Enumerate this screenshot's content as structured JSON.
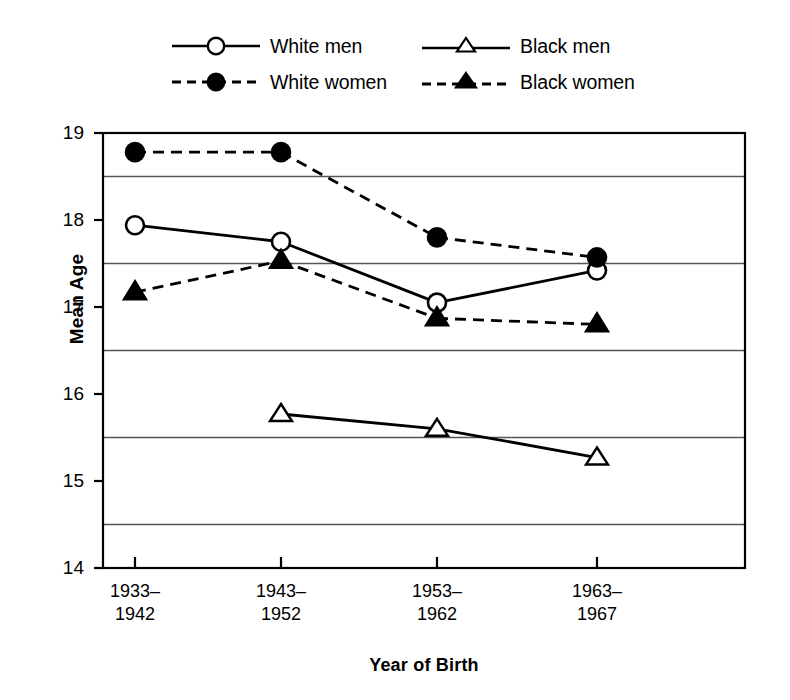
{
  "chart_data": {
    "type": "line",
    "title": "",
    "xlabel": "Year of Birth",
    "ylabel": "Mean Age",
    "categories": [
      "1933–1942",
      "1943–1952",
      "1953–1962",
      "1963–1967"
    ],
    "category_lines": [
      [
        "1933–",
        "1942"
      ],
      [
        "1943–",
        "1952"
      ],
      [
        "1953–",
        "1962"
      ],
      [
        "1963–",
        "1967"
      ]
    ],
    "ylim": [
      14,
      19
    ],
    "yticks": [
      14,
      15,
      16,
      17,
      18,
      19
    ],
    "ytick_labels": [
      "14",
      "15",
      "16",
      "17",
      "18",
      "19"
    ],
    "gridlines": [
      14.5,
      15.5,
      16.5,
      17.5,
      18.5
    ],
    "grid": true,
    "legend_position": "top",
    "series": [
      {
        "name": "White men",
        "marker": "open-circle",
        "line_style": "solid",
        "color": "#000000",
        "values": [
          17.94,
          17.75,
          17.05,
          17.42
        ],
        "points": [
          {
            "category": "1933–1942",
            "value": 17.94
          },
          {
            "category": "1943–1952",
            "value": 17.75
          },
          {
            "category": "1953–1962",
            "value": 17.05
          },
          {
            "category": "1963–1967",
            "value": 17.42
          }
        ]
      },
      {
        "name": "White women",
        "marker": "filled-circle",
        "line_style": "dashed",
        "color": "#000000",
        "values": [
          18.78,
          18.78,
          17.8,
          17.57
        ],
        "points": [
          {
            "category": "1933–1942",
            "value": 18.78
          },
          {
            "category": "1943–1952",
            "value": 18.78
          },
          {
            "category": "1953–1962",
            "value": 17.8
          },
          {
            "category": "1963–1967",
            "value": 17.57
          }
        ]
      },
      {
        "name": "Black men",
        "marker": "open-triangle",
        "line_style": "solid",
        "color": "#000000",
        "values": [
          null,
          15.77,
          15.6,
          15.27
        ],
        "points": [
          {
            "category": "1933–1942",
            "value": null
          },
          {
            "category": "1943–1952",
            "value": 15.77
          },
          {
            "category": "1953–1962",
            "value": 15.6
          },
          {
            "category": "1963–1967",
            "value": 15.27
          }
        ]
      },
      {
        "name": "Black women",
        "marker": "filled-triangle",
        "line_style": "dashed",
        "color": "#000000",
        "values": [
          17.17,
          17.53,
          16.87,
          16.8
        ],
        "points": [
          {
            "category": "1933–1942",
            "value": 17.17
          },
          {
            "category": "1943–1952",
            "value": 17.53
          },
          {
            "category": "1953–1962",
            "value": 16.87
          },
          {
            "category": "1963–1967",
            "value": 16.8
          }
        ]
      }
    ]
  },
  "legend": {
    "entries": [
      {
        "label": "White men"
      },
      {
        "label": "Black men"
      },
      {
        "label": "White women"
      },
      {
        "label": "Black women"
      }
    ]
  },
  "axes": {
    "y_title": "Mean Age",
    "x_title": "Year of Birth"
  }
}
